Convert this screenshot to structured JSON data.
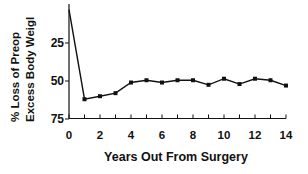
{
  "chart_data": {
    "type": "line",
    "title": "",
    "xlabel": "Years Out From Surgery",
    "ylabel": [
      "% Loss of Preop",
      "Excess Body Weigl"
    ],
    "x": [
      0,
      1,
      2,
      3,
      4,
      5,
      6,
      7,
      8,
      9,
      10,
      11,
      12,
      13,
      14
    ],
    "series": [
      {
        "name": "% Loss of Preop Excess Body Weight",
        "values": [
          3,
          62,
          60,
          58,
          51,
          49.5,
          51,
          49.5,
          49.5,
          52.5,
          48.5,
          52,
          48.5,
          49.5,
          53
        ],
        "marker": "square",
        "color": "#111111"
      }
    ],
    "xticks": [
      0,
      2,
      4,
      6,
      8,
      10,
      12,
      14
    ],
    "xtick_labels": [
      "0",
      "2",
      "4",
      "6",
      "8",
      "10",
      "12",
      "14"
    ],
    "yticks": [
      25,
      50,
      75
    ],
    "ytick_labels": [
      "25",
      "50",
      "75"
    ],
    "xlim": [
      0,
      14
    ],
    "ylim": [
      75,
      0
    ],
    "y_inverted": true,
    "grid": false,
    "legend": null
  }
}
